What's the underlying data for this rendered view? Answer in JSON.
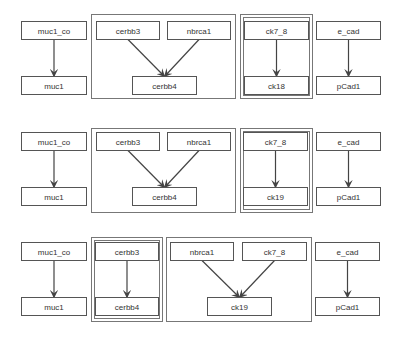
{
  "diagram": {
    "type": "directed-graph-rows",
    "rows": [
      {
        "y_top": 21,
        "y_bottom": 76,
        "groups": [
          {
            "x": 91,
            "y": 14,
            "w": 144,
            "h": 84,
            "double": false
          },
          {
            "x": 240,
            "y": 14,
            "w": 72,
            "h": 84,
            "double": true
          }
        ],
        "nodes": [
          {
            "id": "muc1_co",
            "label": "muc1_co",
            "x": 21,
            "y": 21,
            "w": 65,
            "h": 18
          },
          {
            "id": "muc1",
            "label": "muc1",
            "x": 21,
            "y": 76,
            "w": 65,
            "h": 18
          },
          {
            "id": "cerbb3",
            "label": "cerbb3",
            "x": 96,
            "y": 21,
            "w": 63,
            "h": 18
          },
          {
            "id": "nbrca1",
            "label": "nbrca1",
            "x": 167,
            "y": 21,
            "w": 63,
            "h": 18
          },
          {
            "id": "cerbb4",
            "label": "cerbb4",
            "x": 132,
            "y": 76,
            "w": 64,
            "h": 18
          },
          {
            "id": "ck7_8",
            "label": "ck7_8",
            "x": 244,
            "y": 21,
            "w": 64,
            "h": 18
          },
          {
            "id": "ck18",
            "label": "ck18",
            "x": 244,
            "y": 76,
            "w": 64,
            "h": 18
          },
          {
            "id": "e_cad",
            "label": "e_cad",
            "x": 316,
            "y": 21,
            "w": 64,
            "h": 18
          },
          {
            "id": "pCad1",
            "label": "pCad1",
            "x": 316,
            "y": 76,
            "w": 64,
            "h": 18
          }
        ],
        "edges": [
          {
            "from": "muc1_co",
            "to": "muc1"
          },
          {
            "from": "cerbb3",
            "to": "cerbb4"
          },
          {
            "from": "nbrca1",
            "to": "cerbb4"
          },
          {
            "from": "ck7_8",
            "to": "ck18"
          },
          {
            "from": "e_cad",
            "to": "pCad1"
          }
        ]
      },
      {
        "groups": [
          {
            "x": 91,
            "y": 128,
            "w": 144,
            "h": 84,
            "double": false
          },
          {
            "x": 240,
            "y": 128,
            "w": 72,
            "h": 84,
            "double": true
          }
        ],
        "nodes": [
          {
            "id": "muc1_co",
            "label": "muc1_co",
            "x": 21,
            "y": 132,
            "w": 65,
            "h": 18
          },
          {
            "id": "muc1",
            "label": "muc1",
            "x": 21,
            "y": 187,
            "w": 65,
            "h": 18
          },
          {
            "id": "cerbb3",
            "label": "cerbb3",
            "x": 96,
            "y": 132,
            "w": 63,
            "h": 18
          },
          {
            "id": "nbrca1",
            "label": "nbrca1",
            "x": 167,
            "y": 132,
            "w": 63,
            "h": 18
          },
          {
            "id": "cerbb4",
            "label": "cerbb4",
            "x": 132,
            "y": 187,
            "w": 64,
            "h": 18
          },
          {
            "id": "ck7_8",
            "label": "ck7_8",
            "x": 243,
            "y": 132,
            "w": 64,
            "h": 18
          },
          {
            "id": "ck19",
            "label": "ck19",
            "x": 243,
            "y": 187,
            "w": 64,
            "h": 18
          },
          {
            "id": "e_cad",
            "label": "e_cad",
            "x": 316,
            "y": 132,
            "w": 64,
            "h": 18
          },
          {
            "id": "pCad1",
            "label": "pCad1",
            "x": 316,
            "y": 187,
            "w": 64,
            "h": 18
          }
        ],
        "edges": [
          {
            "from": "muc1_co",
            "to": "muc1"
          },
          {
            "from": "cerbb3",
            "to": "cerbb4"
          },
          {
            "from": "nbrca1",
            "to": "cerbb4"
          },
          {
            "from": "ck7_8",
            "to": "ck19"
          },
          {
            "from": "e_cad",
            "to": "pCad1"
          }
        ]
      },
      {
        "groups": [
          {
            "x": 91,
            "y": 237,
            "w": 71,
            "h": 84,
            "double": true
          },
          {
            "x": 166,
            "y": 237,
            "w": 145,
            "h": 84,
            "double": false
          }
        ],
        "nodes": [
          {
            "id": "muc1_co",
            "label": "muc1_co",
            "x": 21,
            "y": 242,
            "w": 65,
            "h": 18
          },
          {
            "id": "muc1",
            "label": "muc1",
            "x": 21,
            "y": 297,
            "w": 65,
            "h": 18
          },
          {
            "id": "cerbb3",
            "label": "cerbb3",
            "x": 95,
            "y": 242,
            "w": 63,
            "h": 18
          },
          {
            "id": "cerbb4",
            "label": "cerbb4",
            "x": 95,
            "y": 297,
            "w": 63,
            "h": 18
          },
          {
            "id": "nbrca1",
            "label": "nbrca1",
            "x": 170,
            "y": 242,
            "w": 63,
            "h": 18
          },
          {
            "id": "ck7_8",
            "label": "ck7_8",
            "x": 242,
            "y": 242,
            "w": 64,
            "h": 18
          },
          {
            "id": "ck19",
            "label": "ck19",
            "x": 207,
            "y": 297,
            "w": 64,
            "h": 18
          },
          {
            "id": "e_cad",
            "label": "e_cad",
            "x": 315,
            "y": 242,
            "w": 64,
            "h": 18
          },
          {
            "id": "pCad1",
            "label": "pCad1",
            "x": 315,
            "y": 297,
            "w": 64,
            "h": 18
          }
        ],
        "edges": [
          {
            "from": "muc1_co",
            "to": "muc1"
          },
          {
            "from": "cerbb3",
            "to": "cerbb4"
          },
          {
            "from": "nbrca1",
            "to": "ck19"
          },
          {
            "from": "ck7_8",
            "to": "ck19"
          },
          {
            "from": "e_cad",
            "to": "pCad1"
          }
        ]
      }
    ]
  }
}
